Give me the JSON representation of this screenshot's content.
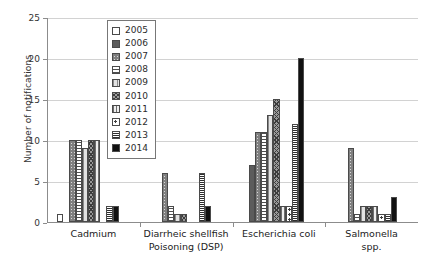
{
  "chart_data": {
    "type": "bar",
    "title": "",
    "xlabel": "",
    "ylabel": "Number of notifications",
    "ylim": [
      0,
      25
    ],
    "yticks": [
      "0",
      "5",
      "10",
      "15",
      "20",
      "25"
    ],
    "grid": true,
    "legend_position": "upper-left-inside",
    "categories": [
      "Cadmium",
      "Diarrheic shellfish\nPoisoning (DSP)",
      "Escherichia coli",
      "Salmonella spp."
    ],
    "series": [
      {
        "name": "2005",
        "pattern": "empty-white",
        "values": [
          1,
          0,
          0,
          0
        ]
      },
      {
        "name": "2006",
        "pattern": "solid-dark-gray",
        "values": [
          0,
          0,
          7,
          0
        ]
      },
      {
        "name": "2007",
        "pattern": "cross-hatch-light",
        "values": [
          10,
          6,
          11,
          9
        ]
      },
      {
        "name": "2008",
        "pattern": "horizontal-lines",
        "values": [
          10,
          2,
          11,
          1
        ]
      },
      {
        "name": "2009",
        "pattern": "vertical-lines-wide",
        "values": [
          9,
          1,
          13,
          2
        ]
      },
      {
        "name": "2010",
        "pattern": "cross-hatch-dark",
        "values": [
          10,
          1,
          15,
          2
        ]
      },
      {
        "name": "2011",
        "pattern": "vertical-lines",
        "values": [
          10,
          0,
          2,
          2
        ]
      },
      {
        "name": "2012",
        "pattern": "dots-open",
        "values": [
          0,
          0,
          2,
          1
        ]
      },
      {
        "name": "2013",
        "pattern": "dense-horizontal",
        "values": [
          2,
          6,
          12,
          1
        ]
      },
      {
        "name": "2014",
        "pattern": "solid-black",
        "values": [
          2,
          2,
          20,
          3
        ]
      }
    ]
  },
  "axis": {
    "y_title": "Number of notifications",
    "y_tick_0": "0",
    "y_tick_1": "5",
    "y_tick_2": "10",
    "y_tick_3": "15",
    "y_tick_4": "20",
    "y_tick_5": "25"
  },
  "legend": {
    "items": [
      {
        "label": "2005"
      },
      {
        "label": "2006"
      },
      {
        "label": "2007"
      },
      {
        "label": "2008"
      },
      {
        "label": "2009"
      },
      {
        "label": "2010"
      },
      {
        "label": "2011"
      },
      {
        "label": "2012"
      },
      {
        "label": "2013"
      },
      {
        "label": "2014"
      }
    ]
  },
  "categories": {
    "c0": "Cadmium",
    "c1": "Diarrheic shellfish\nPoisoning (DSP)",
    "c2": "Escherichia coli",
    "c3": "Salmonella spp."
  },
  "colors": {
    "axis": "#8c8c8c",
    "gridline": "#d2d2d2",
    "bar_outline": "#4a4a4a",
    "text": "#2b2b2b",
    "background": "#ffffff"
  }
}
